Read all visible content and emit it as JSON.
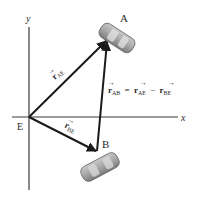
{
  "diagram": {
    "type": "relative-position-vectors",
    "axes": {
      "x_label": "x",
      "y_label": "y",
      "origin_label": "E"
    },
    "points": {
      "A": {
        "label": "A",
        "description": "car A"
      },
      "B": {
        "label": "B",
        "description": "car B"
      }
    },
    "vectors": [
      {
        "id": "r_AE",
        "symbol": "r",
        "subscript": "AE",
        "from": "E",
        "to": "A"
      },
      {
        "id": "r_BE",
        "symbol": "r",
        "subscript": "BE",
        "from": "E",
        "to": "B"
      },
      {
        "id": "r_AB",
        "symbol": "r",
        "subscript": "AB",
        "from": "B",
        "to": "A"
      }
    ],
    "equation": {
      "lhs_symbol": "r",
      "lhs_sub": "AB",
      "eq": "=",
      "t1_symbol": "r",
      "t1_sub": "AE",
      "op": "−",
      "t2_symbol": "r",
      "t2_sub": "BE"
    },
    "colors": {
      "axis": "#3a3a3a",
      "vector": "#1a1a1a",
      "car_body": "#9a9a9a",
      "car_highlight": "#d8d8d8"
    }
  }
}
